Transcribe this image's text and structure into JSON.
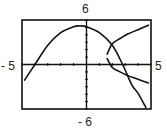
{
  "window": {
    "xmin_label": "- 5",
    "xmax_label": "5",
    "ymin_label": "- 6",
    "ymax_label": "6"
  },
  "chart_data": {
    "type": "line",
    "title": "",
    "xlabel": "",
    "ylabel": "",
    "xlim": [
      -5,
      5
    ],
    "ylim": [
      -6,
      6
    ],
    "grid": false,
    "tick_step": 1,
    "series": [
      {
        "name": "downward parabola",
        "kind": "function_of_x",
        "x": [
          -4.8,
          -4.0,
          -3.0,
          -2.0,
          -1.0,
          -0.5,
          0.0,
          1.0,
          2.0,
          2.8,
          3.5,
          4.0,
          4.6
        ],
        "y": [
          -2.1,
          0.0,
          2.6,
          4.3,
          5.1,
          5.2,
          5.1,
          4.3,
          2.6,
          0.0,
          -2.7,
          -3.9,
          -5.8
        ]
      },
      {
        "name": "sideways parabola (upper branch)",
        "kind": "relation",
        "x": [
          1.6,
          2.0,
          2.6,
          3.2,
          4.0,
          4.8
        ],
        "y": [
          1.4,
          2.8,
          3.5,
          4.1,
          4.7,
          5.3
        ]
      },
      {
        "name": "sideways parabola (lower branch)",
        "kind": "relation",
        "x": [
          1.6,
          2.0,
          2.6,
          3.2,
          4.0,
          4.8
        ],
        "y": [
          0.8,
          -0.4,
          -1.0,
          -1.5,
          -2.0,
          -2.5
        ]
      }
    ],
    "colors": {
      "axis": "#111111",
      "curve": "#111111",
      "frame": "#111111"
    }
  }
}
